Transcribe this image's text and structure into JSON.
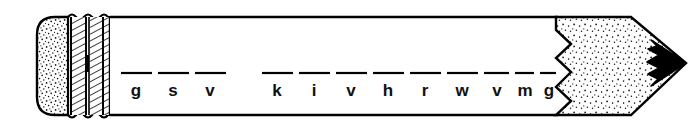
{
  "artwork": {
    "title": "Sharpened pencil with blank-line puzzle",
    "description": "Line drawing of a pencil with eraser, ferrule and sharpened graphite tip; letters written on blank lines along the barrel",
    "background_color": "#ffffff",
    "ink_color": "#000000",
    "graphite_tip_color": "#000000",
    "stipple_color": "#1a1a1a"
  },
  "pencil": {
    "eraser_label": "eraser",
    "ferrule_label": "ferrule",
    "barrel_label": "barrel",
    "wood_cone_label": "sharpened-wood-cone",
    "tip_label": "graphite-tip"
  },
  "puzzle": {
    "groups": [
      {
        "name": "word-1",
        "letters": [
          "g",
          "s",
          "v"
        ]
      },
      {
        "name": "word-2",
        "letters": [
          "k",
          "i",
          "v",
          "h",
          "r",
          "w",
          "v",
          "m",
          "g"
        ]
      }
    ],
    "flat_letters": [
      "g",
      "s",
      "v",
      "k",
      "i",
      "v",
      "h",
      "r",
      "w",
      "v",
      "m",
      "g"
    ],
    "blank_count": 12,
    "group_count": 2
  },
  "geometry": {
    "canvas_width": 699,
    "canvas_height": 127,
    "barrel_top_y": 17,
    "barrel_bottom_y": 115,
    "eraser_left_x": 37,
    "ferrule_left_x": 68,
    "barrel_left_x": 110,
    "cone_left_x": 556,
    "tip_right_x": 686,
    "letter_baseline_y": 96,
    "dash_y": 73
  }
}
